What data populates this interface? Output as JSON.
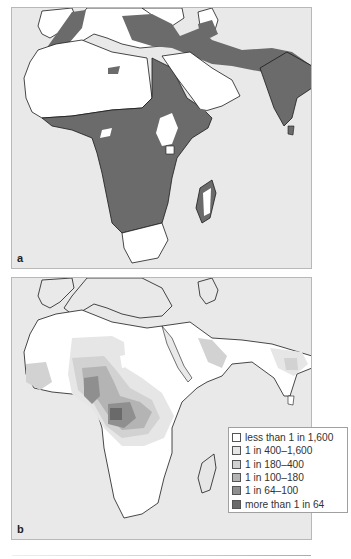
{
  "figure": {
    "panels": [
      {
        "id": "a",
        "label": "a",
        "description": "Distribution of malaria (shaded) across Africa, Mediterranean, Middle East and South Asia"
      },
      {
        "id": "b",
        "label": "b",
        "description": "Frequency of sickle-cell allele across Africa, Middle East and India"
      }
    ]
  },
  "colors": {
    "sea": "#e9e9e9",
    "land": "#ffffff",
    "malaria_region": "#6b6b6b",
    "coastline": "#1a1a1a",
    "panel_border": "#b8b8b8"
  },
  "legend": {
    "items": [
      {
        "label": "less than 1 in 1,600",
        "color": "#ffffff"
      },
      {
        "label": "1 in 400–1,600",
        "color": "#e6e6e6"
      },
      {
        "label": "1 in 180–400",
        "color": "#d2d2d2"
      },
      {
        "label": "1 in 100–180",
        "color": "#b4b4b4"
      },
      {
        "label": "1 in 64–100",
        "color": "#8f8f8f"
      },
      {
        "label": "more than 1 in 64",
        "color": "#6a6a6a"
      }
    ]
  }
}
